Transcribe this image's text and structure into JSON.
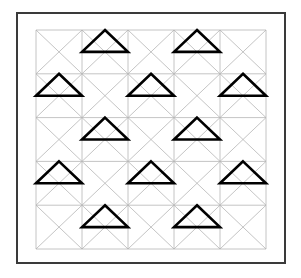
{
  "figure": {
    "type": "geometric-pattern",
    "canvas": {
      "width": 301,
      "height": 278,
      "background": "#ffffff"
    },
    "outer_frame": {
      "x": 17,
      "y": 13,
      "width": 268,
      "height": 250,
      "stroke": "#3a3a3a",
      "stroke_width": 2,
      "fill": "none"
    },
    "grid": {
      "x": 36,
      "y": 30,
      "rows": 5,
      "cols": 5,
      "cell_width": 46,
      "cell_height": 43.8,
      "line_color": "#b5b5b5",
      "line_width": 0.8,
      "diagonals": "both",
      "diagonal_color": "#b5b5b5",
      "diagonal_width": 0.8
    },
    "triangles": {
      "stroke": "#000000",
      "stroke_width": 2.6,
      "fill": "none",
      "shape": "apex-top-center-base-mid-height",
      "cells": [
        {
          "row": 0,
          "col": 1
        },
        {
          "row": 0,
          "col": 3
        },
        {
          "row": 1,
          "col": 0
        },
        {
          "row": 1,
          "col": 2
        },
        {
          "row": 1,
          "col": 4
        },
        {
          "row": 2,
          "col": 1
        },
        {
          "row": 2,
          "col": 3
        },
        {
          "row": 3,
          "col": 0
        },
        {
          "row": 3,
          "col": 2
        },
        {
          "row": 3,
          "col": 4
        },
        {
          "row": 4,
          "col": 1
        },
        {
          "row": 4,
          "col": 3
        }
      ]
    }
  }
}
